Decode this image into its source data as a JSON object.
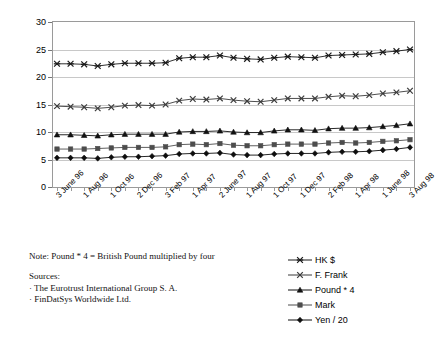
{
  "chart_data": {
    "type": "line",
    "title": "",
    "xlabel": "",
    "ylabel": "",
    "ylim": [
      0,
      30
    ],
    "yticks": [
      0,
      5,
      10,
      15,
      20,
      25,
      30
    ],
    "grid": true,
    "legend_position": "bottom-right",
    "x": [
      "3 June 96",
      "1 July 96",
      "1 Aug 96",
      "2 Sept 96",
      "1 Oct 96",
      "1 Nov 96",
      "2 Dec 96",
      "2 Jan 97",
      "3 Feb 97",
      "3 Mar 97",
      "1 Apr 97",
      "1 May 97",
      "2 June 97",
      "1 July 97",
      "1 Aug 97",
      "1 Sept 97",
      "1 Oct 97",
      "3 Nov 97",
      "1 Dec 97",
      "2 Jan 98",
      "2 Feb 98",
      "2 Mar 98",
      "1 Apr 98",
      "1 May 98",
      "1 June 98",
      "1 July 98",
      "3 Aug 98"
    ],
    "tick_labels": [
      "3 June 96",
      "1 Aug 96",
      "1 Oct 96",
      "2 Dec 96",
      "3 Feb 97",
      "1 Apr 97",
      "2 June 97",
      "1 Aug 97",
      "1 Oct 97",
      "1 Dec 97",
      "2 Feb 98",
      "1 Apr 98",
      "1 June 98",
      "3 Aug 98"
    ],
    "series": [
      {
        "name": "HK $",
        "marker": "star",
        "color": "#1a1a1a",
        "values": [
          22.4,
          22.4,
          22.3,
          22.0,
          22.3,
          22.5,
          22.5,
          22.5,
          22.6,
          23.4,
          23.6,
          23.6,
          23.9,
          23.5,
          23.3,
          23.2,
          23.5,
          23.7,
          23.6,
          23.5,
          23.9,
          24.0,
          24.1,
          24.2,
          24.5,
          24.7,
          25.0
        ]
      },
      {
        "name": "F. Frank",
        "marker": "cross",
        "color": "#3a3a3a",
        "values": [
          14.7,
          14.6,
          14.5,
          14.3,
          14.5,
          14.8,
          14.9,
          14.8,
          15.0,
          15.7,
          16.0,
          15.9,
          16.1,
          15.8,
          15.6,
          15.5,
          15.8,
          16.1,
          16.1,
          16.1,
          16.4,
          16.6,
          16.5,
          16.7,
          17.0,
          17.2,
          17.5
        ]
      },
      {
        "name": "Pound * 4",
        "marker": "triangle",
        "color": "#111111",
        "values": [
          9.5,
          9.5,
          9.4,
          9.3,
          9.5,
          9.6,
          9.6,
          9.6,
          9.6,
          10.0,
          10.1,
          10.1,
          10.2,
          10.0,
          9.9,
          9.9,
          10.2,
          10.4,
          10.4,
          10.3,
          10.6,
          10.7,
          10.7,
          10.8,
          11.0,
          11.2,
          11.5
        ]
      },
      {
        "name": "Mark",
        "marker": "square",
        "color": "#4d4d4d",
        "values": [
          6.9,
          6.9,
          6.9,
          7.0,
          7.1,
          7.2,
          7.2,
          7.2,
          7.3,
          7.7,
          7.8,
          7.7,
          7.9,
          7.6,
          7.5,
          7.5,
          7.7,
          7.8,
          7.8,
          7.8,
          8.0,
          8.1,
          8.0,
          8.1,
          8.3,
          8.4,
          8.6
        ]
      },
      {
        "name": "Yen / 20",
        "marker": "diamond",
        "color": "#0d0d0d",
        "values": [
          5.3,
          5.3,
          5.3,
          5.2,
          5.4,
          5.5,
          5.5,
          5.6,
          5.7,
          6.0,
          6.1,
          6.1,
          6.2,
          5.9,
          5.8,
          5.8,
          6.0,
          6.1,
          6.1,
          6.1,
          6.3,
          6.4,
          6.4,
          6.5,
          6.7,
          6.9,
          7.2
        ]
      }
    ]
  },
  "footer": {
    "note": "Note: Pound * 4 = British Pound multiplied by four",
    "sources_title": "Sources:",
    "sources": [
      "· The Eurotrust International Group S. A.",
      "· FinDatSys Worldwide Ltd."
    ]
  },
  "legend": {
    "items": [
      {
        "label": "HK $"
      },
      {
        "label": "F. Frank"
      },
      {
        "label": "Pound * 4"
      },
      {
        "label": "Mark"
      },
      {
        "label": "Yen / 20"
      }
    ]
  }
}
